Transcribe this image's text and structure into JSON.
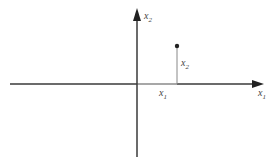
{
  "diagram": {
    "axes": {
      "horizontal_label": "x",
      "horizontal_sub": "1",
      "vertical_label": "x",
      "vertical_sub": "2"
    },
    "point": {
      "x_projection_label": "x",
      "x_projection_sub": "1",
      "y_height_label": "x",
      "y_height_sub": "2"
    },
    "colors": {
      "axis": "#3a3a3a",
      "stem": "#888888",
      "point": "#222222"
    }
  }
}
